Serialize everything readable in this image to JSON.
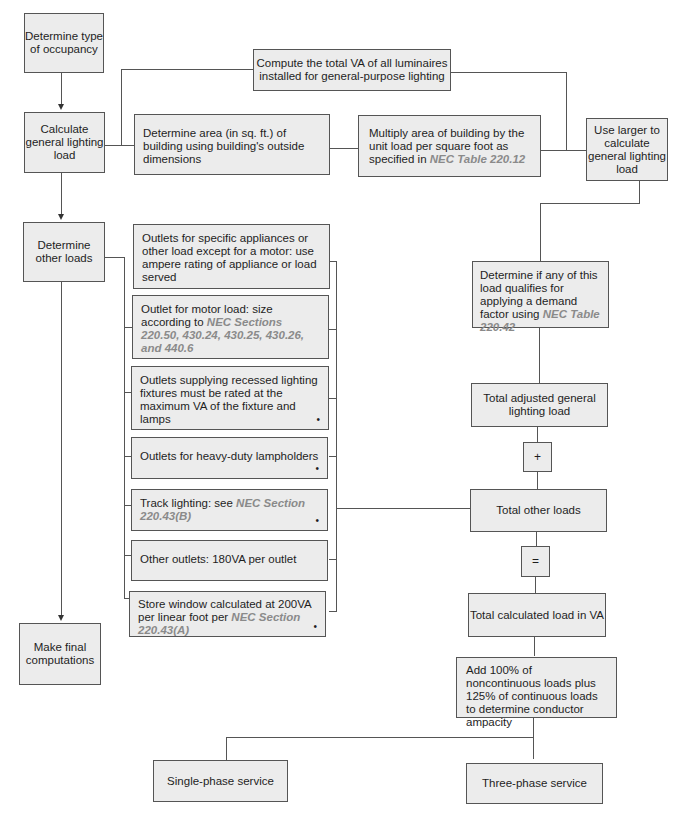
{
  "diagram": {
    "left_column": {
      "occupancy": "Determine type of occupancy",
      "general_lighting": "Calculate general lighting load",
      "other_loads": "Determine other loads",
      "final": "Make final computations"
    },
    "general_lighting_branch": {
      "compute_va": "Compute the total VA of all luminaires installed for general-purpose lighting",
      "determine_area": "Determine area (in sq. ft.) of building using building's outside dimensions",
      "multiply_area_text": "Multiply area of building by the unit load per square foot as specified in",
      "multiply_area_ref": "NEC Table 220.12",
      "use_larger": "Use larger to calculate general lighting load"
    },
    "other_loads_list": [
      {
        "text": "Outlets for specific appliances or other load except for a motor: use ampere rating of appliance or load served",
        "ref": "",
        "marker": ""
      },
      {
        "text": "Outlet for motor load: size according to",
        "ref": "NEC Sections 220.50, 430.24, 430.25, 430.26, and 440.6",
        "marker": ""
      },
      {
        "text": "Outlets supplying recessed lighting fixtures must be rated at the maximum VA of the fixture and lamps",
        "ref": "",
        "marker": "•"
      },
      {
        "text": "Outlets for heavy-duty lampholders",
        "ref": "",
        "marker": "•"
      },
      {
        "text": "Track lighting: see",
        "ref": "NEC Section 220.43(B)",
        "marker": "•"
      },
      {
        "text": "Other outlets: 180VA per outlet",
        "ref": "",
        "marker": ""
      },
      {
        "text": "Store window calculated at 200VA per linear foot per",
        "ref": "NEC Section 220.43(A)",
        "marker": "•"
      }
    ],
    "right_column": {
      "demand_factor_text": "Determine if any of this load qualifies for applying a demand factor using",
      "demand_factor_ref": "NEC Table 220.42",
      "total_adjusted": "Total adjusted general lighting load",
      "plus": "+",
      "total_other": "Total other loads",
      "equals": "=",
      "total_calculated": "Total calculated load in VA",
      "conductor_ampacity": "Add 100% of noncontinuous loads plus 125% of continuous loads to determine conductor ampacity"
    },
    "services": {
      "single_phase": "Single-phase service",
      "three_phase": "Three-phase service"
    },
    "colors": {
      "box_fill": "#ececec",
      "border": "#555555",
      "reference_text": "#8a8a8a"
    }
  }
}
